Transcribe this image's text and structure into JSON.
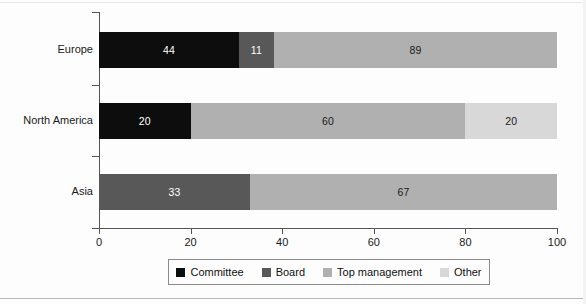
{
  "chart_data": {
    "type": "bar",
    "orientation": "horizontal",
    "stacked": true,
    "title": "",
    "subtitle": "",
    "xlabel": "",
    "ylabel": "",
    "xlim": [
      0,
      100
    ],
    "xticks": [
      0,
      20,
      40,
      60,
      80,
      100
    ],
    "xtick_labels": [
      "0",
      "20",
      "40",
      "60",
      "80",
      "100"
    ],
    "grid": false,
    "legend_position": "bottom",
    "categories": [
      "Europe",
      "North America",
      "Asia"
    ],
    "series": [
      {
        "name": "Committee",
        "color": "#0d0d0d",
        "values": [
          44,
          20,
          0
        ]
      },
      {
        "name": "Board",
        "color": "#585858",
        "values": [
          11,
          0,
          33
        ]
      },
      {
        "name": "Top management",
        "color": "#b0b0b0",
        "values": [
          89,
          60,
          67
        ]
      },
      {
        "name": "Other",
        "color": "#d8d8d8",
        "values": [
          0,
          20,
          0
        ]
      }
    ],
    "bars": [
      {
        "category": "Europe",
        "segments": [
          {
            "series": "Committee",
            "label": "44",
            "value": 44,
            "start_pct": 0,
            "width_pct": 30.56,
            "color": "#0d0d0d",
            "text_color": "#ffffff"
          },
          {
            "series": "Board",
            "label": "11",
            "value": 11,
            "start_pct": 30.56,
            "width_pct": 7.64,
            "color": "#585858",
            "text_color": "#ffffff"
          },
          {
            "series": "Top management",
            "label": "89",
            "value": 89,
            "start_pct": 38.2,
            "width_pct": 61.8,
            "color": "#b0b0b0",
            "text_color": "#1a1a1a"
          }
        ]
      },
      {
        "category": "North America",
        "segments": [
          {
            "series": "Committee",
            "label": "20",
            "value": 20,
            "start_pct": 0,
            "width_pct": 20,
            "color": "#0d0d0d",
            "text_color": "#ffffff"
          },
          {
            "series": "Top management",
            "label": "60",
            "value": 60,
            "start_pct": 20,
            "width_pct": 60,
            "color": "#b0b0b0",
            "text_color": "#1a1a1a"
          },
          {
            "series": "Other",
            "label": "20",
            "value": 20,
            "start_pct": 80,
            "width_pct": 20,
            "color": "#d8d8d8",
            "text_color": "#1a1a1a"
          }
        ]
      },
      {
        "category": "Asia",
        "segments": [
          {
            "series": "Board",
            "label": "33",
            "value": 33,
            "start_pct": 0,
            "width_pct": 33,
            "color": "#585858",
            "text_color": "#ffffff"
          },
          {
            "series": "Top management",
            "label": "67",
            "value": 67,
            "start_pct": 33,
            "width_pct": 67,
            "color": "#b0b0b0",
            "text_color": "#1a1a1a"
          }
        ]
      }
    ],
    "legend": [
      {
        "label": "Committee",
        "color": "#0d0d0d"
      },
      {
        "label": "Board",
        "color": "#585858"
      },
      {
        "label": "Top management",
        "color": "#b0b0b0"
      },
      {
        "label": "Other",
        "color": "#d8d8d8"
      }
    ]
  },
  "axis": {
    "x_tick_labels": [
      "0",
      "20",
      "40",
      "60",
      "80",
      "100"
    ]
  },
  "colors": {
    "axis": "#555555",
    "background": "#fdfdfd",
    "legend_border": "#8a8a8a"
  }
}
